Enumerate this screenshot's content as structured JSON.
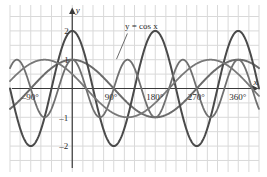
{
  "chart_data": {
    "type": "line",
    "title": "",
    "xlabel": "x",
    "ylabel": "y",
    "xlim": [
      -135,
      405
    ],
    "ylim": [
      -2.9,
      2.9
    ],
    "grid": true,
    "legend_position": "inline-annotation",
    "x_unit": "degrees",
    "annotations": [
      {
        "text": "y = cos x",
        "x": 150,
        "y": 2.05,
        "points_to_x": 96,
        "points_to_y": 1.02
      }
    ],
    "x_ticks": [
      {
        "value": -90,
        "label": "–90°"
      },
      {
        "value": 90,
        "label": "90°"
      },
      {
        "value": 180,
        "label": "180°"
      },
      {
        "value": 270,
        "label": "270°"
      },
      {
        "value": 360,
        "label": "360°"
      }
    ],
    "y_ticks": [
      {
        "value": 2,
        "label": "2"
      },
      {
        "value": 1,
        "label": "1"
      },
      {
        "value": -1,
        "label": "–1"
      },
      {
        "value": -2,
        "label": "–2"
      }
    ],
    "x_gridlines": [
      -135,
      -113,
      -90,
      -68,
      -45,
      -23,
      0,
      23,
      45,
      68,
      90,
      113,
      135,
      158,
      180,
      203,
      225,
      248,
      270,
      293,
      315,
      338,
      360,
      383,
      405
    ],
    "y_gridlines": [
      -2.5,
      -2.0,
      -1.5,
      -1.0,
      -0.5,
      0,
      0.5,
      1.0,
      1.5,
      2.0,
      2.5
    ],
    "series": [
      {
        "name": "y = cos x",
        "color": "#6b6b6b",
        "width": 2.0,
        "amplitude": 1,
        "period": 360,
        "phase": 0,
        "formula": "cos(x)"
      },
      {
        "name": "y = 2 cos 2x",
        "color": "#4a4a4a",
        "width": 2.0,
        "amplitude": 2,
        "period": 180,
        "phase": 0,
        "formula": "2*cos(2x)"
      },
      {
        "name": "y = cos 3x",
        "color": "#707070",
        "width": 1.8,
        "amplitude": 1,
        "period": 120,
        "phase": 0,
        "formula": "cos(3x)"
      },
      {
        "name": "y = cos (x + 60)",
        "color": "#787878",
        "width": 1.8,
        "amplitude": 1,
        "period": 360,
        "phase": 60,
        "formula": "cos(x+60)"
      }
    ]
  },
  "axes": {
    "y_axis_label": "y",
    "x_axis_label": "x"
  }
}
